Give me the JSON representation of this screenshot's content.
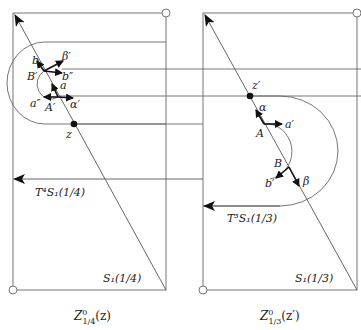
{
  "left_panel": {
    "caption_main": "Z",
    "caption_sup": "0",
    "caption_sub": "1/4",
    "caption_arg": "(z)",
    "point_z": "z",
    "label_b": "b",
    "label_beta_prime": "β′",
    "label_B_prime": "B′",
    "label_b_double_prime": "b″",
    "label_a": "a",
    "label_a_double_prime": "a″",
    "label_A_prime": "A′",
    "label_alpha_prime": "α′",
    "curve_T": "T⁴S₁(1/4)",
    "curve_S": "S₁(1/4)"
  },
  "right_panel": {
    "caption_main": "Z",
    "caption_sup": "0",
    "caption_sub": "1/3",
    "caption_arg": "(z′)",
    "point_z": "z′",
    "label_alpha": "α",
    "label_A": "A",
    "label_a_prime": "a′",
    "label_B": "B",
    "label_b_prime": "b′",
    "label_beta": "β",
    "curve_T": "T³S₁(1/3)",
    "curve_S": "S₁(1/3)"
  },
  "colors": {
    "line": "#555555",
    "ink": "#111111"
  }
}
